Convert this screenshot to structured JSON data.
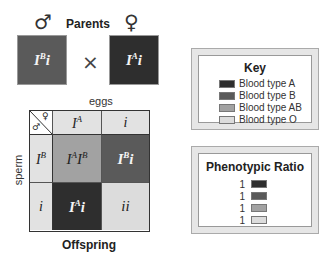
{
  "header": {
    "title": "Parents",
    "male_symbol": "♂",
    "female_symbol": "♀",
    "cross_symbol": "×"
  },
  "parents": {
    "male": {
      "allele1": "I",
      "allele1_sup": "B",
      "allele2": "i",
      "color": "#5a5a5a"
    },
    "female": {
      "allele1": "I",
      "allele1_sup": "A",
      "allele2": "i",
      "color": "#2e2e2e"
    }
  },
  "punnett": {
    "top_label": "eggs",
    "side_label": "sperm",
    "bottom_label": "Offspring",
    "corner": {
      "male": "♂",
      "female": "♀"
    },
    "col_headers": [
      {
        "base": "I",
        "sup": "A",
        "rest": ""
      },
      {
        "base": "i",
        "sup": "",
        "rest": ""
      }
    ],
    "row_headers": [
      {
        "base": "I",
        "sup": "B",
        "rest": ""
      },
      {
        "base": "i",
        "sup": "",
        "rest": ""
      }
    ],
    "cells": [
      [
        {
          "a": "I",
          "a_sup": "A",
          "b": "I",
          "b_sup": "B",
          "color": "#a2a2a2",
          "text_color": "dark"
        },
        {
          "a": "I",
          "a_sup": "B",
          "b": "i",
          "b_sup": "",
          "color": "#5a5a5a",
          "text_color": "white"
        }
      ],
      [
        {
          "a": "I",
          "a_sup": "A",
          "b": "i",
          "b_sup": "",
          "color": "#2e2e2e",
          "text_color": "white"
        },
        {
          "a": "ii",
          "a_sup": "",
          "b": "",
          "b_sup": "",
          "color": "#dcdcdc",
          "text_color": "dark"
        }
      ]
    ],
    "header_color": "#e2e2e2"
  },
  "key": {
    "title": "Key",
    "items": [
      {
        "label": "Blood type A",
        "color": "#2e2e2e"
      },
      {
        "label": "Blood type B",
        "color": "#5a5a5a"
      },
      {
        "label": "Blood type AB",
        "color": "#a2a2a2"
      },
      {
        "label": "Blood type O",
        "color": "#dcdcdc"
      }
    ]
  },
  "ratio": {
    "title": "Phenotypic Ratio",
    "items": [
      {
        "value": "1",
        "color": "#2e2e2e"
      },
      {
        "value": "1",
        "color": "#5a5a5a"
      },
      {
        "value": "1",
        "color": "#a2a2a2"
      },
      {
        "value": "1",
        "color": "#dcdcdc"
      }
    ]
  }
}
